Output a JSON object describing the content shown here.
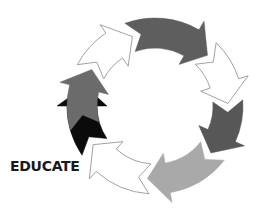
{
  "diagram": {
    "type": "cycle",
    "center": [
      155,
      106
    ],
    "outer_radius": 88,
    "inner_radius": 58,
    "stroke_color": "#8a8a8a",
    "segments": [
      {
        "name": "arrow-top-left-white",
        "fill": "#ffffff",
        "start": 152,
        "end": 108
      },
      {
        "name": "arrow-top-grey",
        "fill": "#5e5e5e",
        "start": 110,
        "end": 44
      },
      {
        "name": "arrow-top-right-white",
        "fill": "#ffffff",
        "start": 46,
        "end": 2
      },
      {
        "name": "arrow-right-grey",
        "fill": "#575757",
        "start": 4,
        "end": -40
      },
      {
        "name": "arrow-bottom-right-light",
        "fill": "#a9a9a9",
        "start": -38,
        "end": -96
      },
      {
        "name": "arrow-bottom-white",
        "fill": "#ffffff",
        "start": -94,
        "end": -148
      },
      {
        "name": "arrow-bottom-left-black",
        "fill": "#0b0b0b",
        "start": -146,
        "end": -196
      },
      {
        "name": "arrow-left-grey",
        "fill": "#6b6b6b",
        "start": 196,
        "end": 150
      }
    ]
  },
  "labels": {
    "educate": "EDUCATE"
  }
}
